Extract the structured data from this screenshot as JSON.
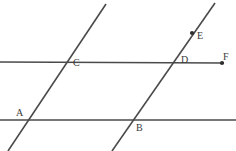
{
  "figure": {
    "width": 236,
    "height": 151,
    "background_color": "#ffffff",
    "stroke_color": "#4a4a4a",
    "label_color": "#3a3a3a",
    "stroke_width": 1.6,
    "label_font_size": 10
  },
  "lines": [
    {
      "name": "upper-horizontal-line",
      "kind": "horizontal",
      "x1": 0,
      "y1": 62,
      "x2": 224,
      "y2": 63,
      "passes_through": [
        "C",
        "D",
        "F"
      ]
    },
    {
      "name": "lower-horizontal-line",
      "kind": "horizontal",
      "x1": 0,
      "y1": 120,
      "x2": 236,
      "y2": 120,
      "passes_through": [
        "A",
        "B"
      ]
    },
    {
      "name": "left-transversal-line",
      "kind": "transversal",
      "x1": 106,
      "y1": 4,
      "x2": 8,
      "y2": 151,
      "passes_through": [
        "C",
        "A"
      ]
    },
    {
      "name": "right-transversal-line",
      "kind": "transversal",
      "x1": 215,
      "y1": 3,
      "x2": 112,
      "y2": 151,
      "passes_through": [
        "E",
        "D",
        "B"
      ]
    }
  ],
  "points": [
    {
      "id": "A",
      "label": "A",
      "x": 28,
      "y": 120,
      "label_x": 16,
      "label_y": 108,
      "dot": false,
      "description": "intersection of left transversal and lower horizontal line"
    },
    {
      "id": "B",
      "label": "B",
      "x": 133,
      "y": 120,
      "label_x": 136,
      "label_y": 123,
      "dot": false,
      "description": "intersection of right transversal and lower horizontal line"
    },
    {
      "id": "C",
      "label": "C",
      "x": 70,
      "y": 62,
      "label_x": 73,
      "label_y": 58,
      "dot": false,
      "description": "intersection of left transversal and upper horizontal line"
    },
    {
      "id": "D",
      "label": "D",
      "x": 173,
      "y": 63,
      "label_x": 181,
      "label_y": 55,
      "dot": false,
      "description": "intersection of right transversal and upper horizontal line"
    },
    {
      "id": "E",
      "label": "E",
      "x": 192,
      "y": 33,
      "label_x": 197,
      "label_y": 31,
      "dot": true,
      "description": "marked point on right transversal above the upper horizontal line"
    },
    {
      "id": "F",
      "label": "F",
      "x": 222,
      "y": 63,
      "label_x": 223,
      "label_y": 52,
      "dot": true,
      "description": "marked endpoint on the upper horizontal line at the right"
    }
  ]
}
